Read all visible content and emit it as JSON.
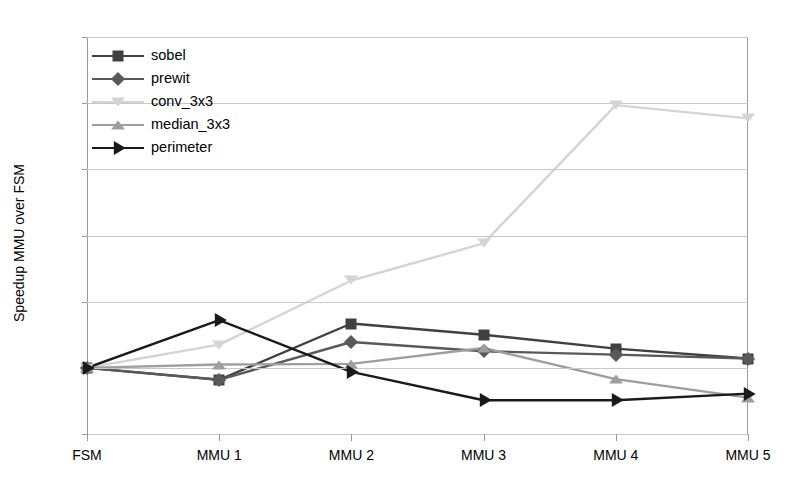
{
  "chart_data": {
    "type": "line",
    "title": "",
    "xlabel": "",
    "ylabel": "Speedup MMU over FSM",
    "categories": [
      "FSM",
      "MMU 1",
      "MMU 2",
      "MMU 3",
      "MMU 4",
      "MMU 5"
    ],
    "ylim": [
      0,
      6
    ],
    "yticks": [
      "0",
      "1",
      "2",
      "3",
      "4",
      "5",
      "6"
    ],
    "grid": true,
    "legend_position": "top-left",
    "series": [
      {
        "name": "sobel",
        "marker": "square",
        "color": "#404040",
        "values": [
          1.0,
          0.82,
          1.67,
          1.5,
          1.29,
          1.14
        ]
      },
      {
        "name": "prewit",
        "marker": "diamond",
        "color": "#595959",
        "values": [
          1.0,
          0.82,
          1.39,
          1.25,
          1.2,
          1.14
        ]
      },
      {
        "name": "conv_3x3",
        "marker": "triangle-down",
        "color": "#d4d4d4",
        "values": [
          1.0,
          1.35,
          2.32,
          2.88,
          4.97,
          4.77
        ]
      },
      {
        "name": "median_3x3",
        "marker": "triangle-up",
        "color": "#9e9e9e",
        "values": [
          1.0,
          1.05,
          1.06,
          1.3,
          0.83,
          0.55
        ]
      },
      {
        "name": "perimeter",
        "marker": "arrow-right",
        "color": "#1a1a1a",
        "values": [
          1.0,
          1.72,
          0.94,
          0.51,
          0.51,
          0.61
        ]
      }
    ]
  }
}
